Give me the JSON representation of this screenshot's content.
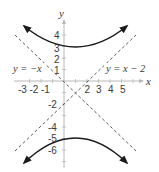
{
  "figure": {
    "type": "hyperbola-graph",
    "equation_implied": "(y+1)^2/16 - (x-1)^2/16 = 1",
    "center": [
      1,
      -1
    ],
    "vertices": [
      [
        1,
        3
      ],
      [
        1,
        -5
      ]
    ],
    "axes": {
      "x_label": "x",
      "y_label": "y",
      "x_ticks": [
        "-3",
        "-2",
        "-1",
        "2",
        "3",
        "4",
        "5"
      ],
      "y_ticks": [
        "4",
        "3",
        "2",
        "1",
        "-2",
        "-4",
        "-5",
        "-6"
      ]
    },
    "asymptotes": [
      {
        "label": "y = −x",
        "slope": -1,
        "intercept": 0
      },
      {
        "label": "y = x − 2",
        "slope": 1,
        "intercept": -2
      }
    ],
    "colors": {
      "curve": "#1a1a1a",
      "asymptote": "#4a4a4a",
      "axis": "#b8b8b8",
      "text": "#3a3a3a"
    }
  }
}
